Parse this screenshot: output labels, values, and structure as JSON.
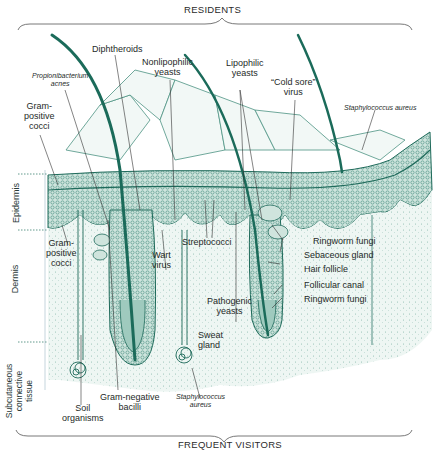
{
  "figure": {
    "top_bracket_label": "RESIDENTS",
    "bottom_bracket_label": "FREQUENT VISITORS",
    "colors": {
      "ink": "#1e5a50",
      "tissue_fill": "#dcebe6",
      "dense_fill": "#7fb3a6",
      "hair": "#1b6b5a",
      "label_text": "#1e2a28",
      "background": "#ffffff"
    }
  },
  "layers": {
    "epidermis": "Epidermis",
    "dermis": "Dermis",
    "subcutaneous": [
      "Subcutaneous",
      "connective",
      "tissue"
    ]
  },
  "labels": {
    "diphtheroids": "Diphtheroids",
    "nonlipophilic_yeasts": [
      "Nonlipophilic",
      "yeasts"
    ],
    "propionibacterium": [
      "Propionibacterium",
      "acnes"
    ],
    "gram_positive_cocci_top": [
      "Gram-",
      "positive",
      "cocci"
    ],
    "lipophilic_yeasts": [
      "Lipophilic",
      "yeasts"
    ],
    "cold_sore_virus": [
      "“Cold sore”",
      "virus"
    ],
    "staph_aureus_top": "Staphylococcus aureus",
    "gram_positive_cocci_dermis": [
      "Gram-",
      "positive",
      "cocci"
    ],
    "wart_virus": [
      "Wart",
      "virus"
    ],
    "streptococci": "Streptococci",
    "ringworm_fungi_1": "Ringworm fungi",
    "sebaceous_gland": "Sebaceous gland",
    "hair_follicle": "Hair follicle",
    "follicular_canal": "Follicular canal",
    "ringworm_fungi_2": "Ringworm fungi",
    "pathogenic_yeasts": [
      "Pathogenic",
      "yeasts"
    ],
    "sweat_gland": [
      "Sweat",
      "gland"
    ],
    "soil_organisms": [
      "Soil",
      "organisms"
    ],
    "gram_negative_bacilli": [
      "Gram-negative",
      "bacilli"
    ],
    "staph_aureus_bottom": [
      "Staphylococcus",
      "aureus"
    ]
  }
}
